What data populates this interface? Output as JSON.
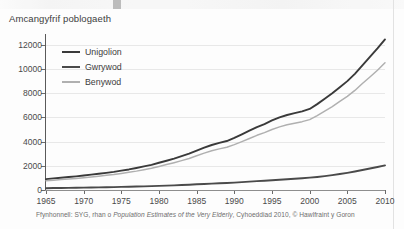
{
  "chart_title": "Amcangyfrif poblogaeth",
  "footnote": {
    "prefix": "Ffynhonnell: SYG, rhan o ",
    "italic": "Population Estimates of the Very Elderly",
    "suffix": ", Cyhoeddiad 2010, © Hawlfraint y Goron"
  },
  "legend": {
    "items": [
      {
        "label": "Unigolion",
        "color": "#3a3a3a"
      },
      {
        "label": "Gwrywod",
        "color": "#4a4a4a"
      },
      {
        "label": "Benywod",
        "color": "#b0b0b0"
      }
    ]
  },
  "axes": {
    "y_ticks": [
      "0",
      "2000",
      "4000",
      "6000",
      "8000",
      "10000",
      "12000"
    ],
    "x_ticks": [
      "1965",
      "1970",
      "1975",
      "1980",
      "1985",
      "1990",
      "1995",
      "2000",
      "2005",
      "2010"
    ]
  },
  "chart_data": {
    "type": "line",
    "title": "Amcangyfrif poblogaeth",
    "xlabel": "",
    "ylabel": "",
    "xlim": [
      1965,
      2010
    ],
    "ylim": [
      0,
      12400
    ],
    "grid": true,
    "legend_position": "top-left",
    "x": [
      1965,
      1966,
      1967,
      1968,
      1969,
      1970,
      1971,
      1972,
      1973,
      1974,
      1975,
      1976,
      1977,
      1978,
      1979,
      1980,
      1981,
      1982,
      1983,
      1984,
      1985,
      1986,
      1987,
      1988,
      1989,
      1990,
      1991,
      1992,
      1993,
      1994,
      1995,
      1996,
      1997,
      1998,
      1999,
      2000,
      2001,
      2002,
      2003,
      2004,
      2005,
      2006,
      2007,
      2008,
      2009,
      2010
    ],
    "series": [
      {
        "name": "Unigolion",
        "color": "#3a3a3a",
        "values": [
          900,
          960,
          1010,
          1070,
          1130,
          1200,
          1270,
          1340,
          1420,
          1500,
          1600,
          1700,
          1820,
          1950,
          2080,
          2250,
          2420,
          2600,
          2800,
          3000,
          3250,
          3500,
          3720,
          3900,
          4050,
          4300,
          4600,
          4900,
          5200,
          5450,
          5750,
          6000,
          6200,
          6350,
          6500,
          6700,
          7100,
          7550,
          8000,
          8500,
          9000,
          9600,
          10300,
          11000,
          11700,
          12450
        ]
      },
      {
        "name": "Benywod",
        "color": "#b0b0b0",
        "values": [
          760,
          810,
          860,
          910,
          960,
          1020,
          1080,
          1140,
          1210,
          1280,
          1370,
          1460,
          1560,
          1680,
          1800,
          1950,
          2100,
          2260,
          2430,
          2610,
          2830,
          3050,
          3240,
          3400,
          3530,
          3750,
          4000,
          4260,
          4520,
          4740,
          5000,
          5220,
          5400,
          5520,
          5650,
          5820,
          6150,
          6520,
          6900,
          7320,
          7740,
          8230,
          8800,
          9340,
          9900,
          10520
        ]
      },
      {
        "name": "Gwrywod",
        "color": "#4a4a4a",
        "values": [
          150,
          160,
          165,
          175,
          185,
          195,
          205,
          215,
          225,
          240,
          255,
          270,
          285,
          300,
          320,
          340,
          360,
          385,
          410,
          440,
          470,
          500,
          530,
          555,
          580,
          610,
          650,
          690,
          730,
          770,
          810,
          850,
          890,
          930,
          970,
          1020,
          1080,
          1150,
          1230,
          1320,
          1420,
          1530,
          1650,
          1780,
          1900,
          2030
        ]
      }
    ]
  }
}
